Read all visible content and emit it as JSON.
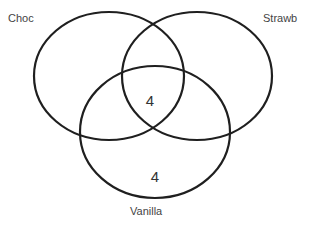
{
  "diagram": {
    "type": "venn",
    "sets": [
      {
        "id": "choc",
        "label": "Choc"
      },
      {
        "id": "strawb",
        "label": "Strawb"
      },
      {
        "id": "vanilla",
        "label": "Vanilla"
      }
    ],
    "regions": [
      {
        "sets": [
          "choc",
          "strawb",
          "vanilla"
        ],
        "value": "4"
      },
      {
        "sets": [
          "vanilla"
        ],
        "value": "4"
      }
    ],
    "stroke_color": "#1f1f1f"
  }
}
